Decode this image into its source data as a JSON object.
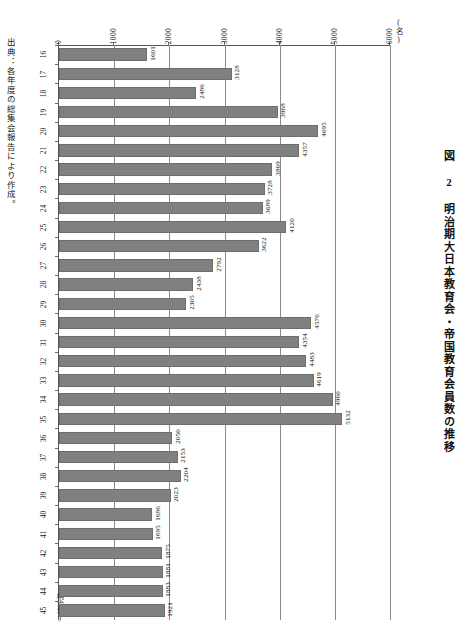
{
  "running_header": "",
  "figure_title": "図 2  明治期大日本教育会・帝国教育会員数の推移",
  "source_note": "出典：各年度の総集会報告により作成。",
  "unit_label": "(名)",
  "category_axis_caption": "(明治年)",
  "chart_data": {
    "type": "bar",
    "orientation": "horizontal-rotated",
    "title": "図 2  明治期大日本教育会・帝国教育会員数の推移",
    "xlabel": "(明治年)",
    "ylabel": "(名)",
    "ylim": [
      0,
      6000
    ],
    "grid": true,
    "legend": "none",
    "ticks": [
      0,
      1000,
      2000,
      3000,
      4000,
      5000,
      6000
    ],
    "tick_labels": [
      "0",
      "1000",
      "2000",
      "3000",
      "4000",
      "5000",
      "6000"
    ],
    "categories": [
      "16",
      "17",
      "18",
      "19",
      "20",
      "21",
      "22",
      "23",
      "24",
      "25",
      "26",
      "27",
      "28",
      "29",
      "30",
      "31",
      "32",
      "33",
      "34",
      "35",
      "36",
      "37",
      "38",
      "39",
      "40",
      "41",
      "42",
      "43",
      "44",
      "45"
    ],
    "values": [
      1601,
      3128,
      2486,
      3968,
      4695,
      4357,
      3869,
      3728,
      3689,
      4120,
      3622,
      2792,
      2438,
      2305,
      4576,
      4354,
      4483,
      4619,
      4960,
      5132,
      2050,
      2153,
      2204,
      2023,
      1686,
      1695,
      1875,
      1881,
      1883,
      1921
    ],
    "bar_color": "#808080"
  }
}
